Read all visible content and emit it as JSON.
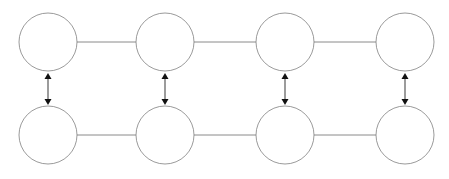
{
  "canvas": {
    "width": 449,
    "height": 179,
    "background": "#ffffff"
  },
  "style": {
    "node_stroke": "#808080",
    "node_fill": "#ffffff",
    "node_stroke_width": 0.8,
    "edge_stroke": "#8a8a8a",
    "edge_stroke_width": 1,
    "arrow_stroke": "#5a5a5a",
    "arrow_head_fill": "#111111",
    "arrow_stroke_width": 1.2
  },
  "geometry": {
    "radius": 29,
    "row_top_cy": 42,
    "row_bottom_cy": 135,
    "column_cx": [
      48,
      165,
      285,
      405
    ]
  },
  "diagram": {
    "title": "",
    "type": "node-grid",
    "rows": 2,
    "columns": 4
  },
  "nodes": [
    {
      "id": "n-r1-c1",
      "row": 0,
      "col": 0,
      "cx": 48,
      "cy": 42,
      "r": 29,
      "label": ""
    },
    {
      "id": "n-r1-c2",
      "row": 0,
      "col": 1,
      "cx": 165,
      "cy": 42,
      "r": 29,
      "label": ""
    },
    {
      "id": "n-r1-c3",
      "row": 0,
      "col": 2,
      "cx": 285,
      "cy": 42,
      "r": 29,
      "label": ""
    },
    {
      "id": "n-r1-c4",
      "row": 0,
      "col": 3,
      "cx": 405,
      "cy": 42,
      "r": 29,
      "label": ""
    },
    {
      "id": "n-r2-c1",
      "row": 1,
      "col": 0,
      "cx": 48,
      "cy": 135,
      "r": 29,
      "label": ""
    },
    {
      "id": "n-r2-c2",
      "row": 1,
      "col": 1,
      "cx": 165,
      "cy": 135,
      "r": 29,
      "label": ""
    },
    {
      "id": "n-r2-c3",
      "row": 1,
      "col": 2,
      "cx": 285,
      "cy": 135,
      "r": 29,
      "label": ""
    },
    {
      "id": "n-r2-c4",
      "row": 1,
      "col": 3,
      "cx": 405,
      "cy": 135,
      "r": 29,
      "label": ""
    }
  ],
  "horizontal_edges": [
    {
      "id": "e-r1-c1-c2",
      "from": "n-r1-c1",
      "to": "n-r1-c2",
      "x1": 77,
      "x2": 136,
      "y": 42,
      "arrow": false
    },
    {
      "id": "e-r1-c2-c3",
      "from": "n-r1-c2",
      "to": "n-r1-c3",
      "x1": 194,
      "x2": 256,
      "y": 42,
      "arrow": false
    },
    {
      "id": "e-r1-c3-c4",
      "from": "n-r1-c3",
      "to": "n-r1-c4",
      "x1": 314,
      "x2": 376,
      "y": 42,
      "arrow": false
    },
    {
      "id": "e-r2-c1-c2",
      "from": "n-r2-c1",
      "to": "n-r2-c2",
      "x1": 77,
      "x2": 136,
      "y": 135,
      "arrow": false
    },
    {
      "id": "e-r2-c2-c3",
      "from": "n-r2-c2",
      "to": "n-r2-c3",
      "x1": 194,
      "x2": 256,
      "y": 135,
      "arrow": false
    },
    {
      "id": "e-r2-c3-c4",
      "from": "n-r2-c3",
      "to": "n-r2-c4",
      "x1": 314,
      "x2": 376,
      "y": 135,
      "arrow": false
    }
  ],
  "vertical_edges": [
    {
      "id": "v-c1",
      "from": "n-r1-c1",
      "to": "n-r2-c1",
      "x": 48,
      "y1": 73,
      "y2": 105,
      "arrow": "double"
    },
    {
      "id": "v-c2",
      "from": "n-r1-c2",
      "to": "n-r2-c2",
      "x": 165,
      "y1": 73,
      "y2": 105,
      "arrow": "double"
    },
    {
      "id": "v-c3",
      "from": "n-r1-c3",
      "to": "n-r2-c3",
      "x": 285,
      "y1": 73,
      "y2": 105,
      "arrow": "double"
    },
    {
      "id": "v-c4",
      "from": "n-r1-c4",
      "to": "n-r2-c4",
      "x": 405,
      "y1": 73,
      "y2": 105,
      "arrow": "double"
    }
  ]
}
